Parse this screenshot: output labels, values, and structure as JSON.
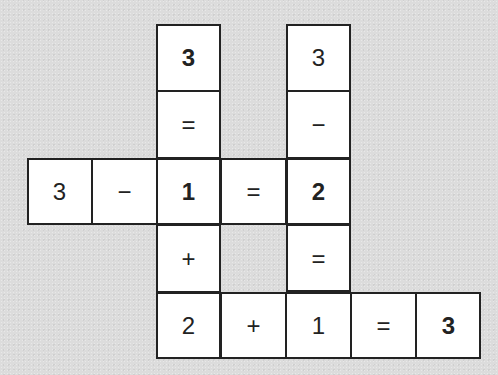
{
  "puzzle": {
    "type": "number-crossword",
    "cell_width": 65,
    "cell_height": 67,
    "origin_x": 27,
    "origin_y": 24,
    "cells": [
      {
        "row": 0,
        "col": 2,
        "value": "3",
        "bold": true
      },
      {
        "row": 0,
        "col": 4,
        "value": "3",
        "bold": false
      },
      {
        "row": 1,
        "col": 2,
        "value": "=",
        "bold": false
      },
      {
        "row": 1,
        "col": 4,
        "value": "−",
        "bold": false
      },
      {
        "row": 2,
        "col": 0,
        "value": "3",
        "bold": false
      },
      {
        "row": 2,
        "col": 1,
        "value": "−",
        "bold": false
      },
      {
        "row": 2,
        "col": 2,
        "value": "1",
        "bold": true
      },
      {
        "row": 2,
        "col": 3,
        "value": "=",
        "bold": false
      },
      {
        "row": 2,
        "col": 4,
        "value": "2",
        "bold": true
      },
      {
        "row": 3,
        "col": 2,
        "value": "+",
        "bold": false
      },
      {
        "row": 3,
        "col": 4,
        "value": "=",
        "bold": false
      },
      {
        "row": 4,
        "col": 2,
        "value": "2",
        "bold": false
      },
      {
        "row": 4,
        "col": 3,
        "value": "+",
        "bold": false
      },
      {
        "row": 4,
        "col": 4,
        "value": "1",
        "bold": false
      },
      {
        "row": 4,
        "col": 5,
        "value": "=",
        "bold": false
      },
      {
        "row": 4,
        "col": 6,
        "value": "3",
        "bold": true
      }
    ],
    "equations": [
      "3 − 1 = 2",
      "2 + 1 = 3",
      "3 = 1 + 2",
      "3 − 2 = 1"
    ]
  },
  "colors": {
    "background": "#dcdcdc",
    "cell": "#ffffff",
    "line": "#222222",
    "text": "#222222"
  }
}
